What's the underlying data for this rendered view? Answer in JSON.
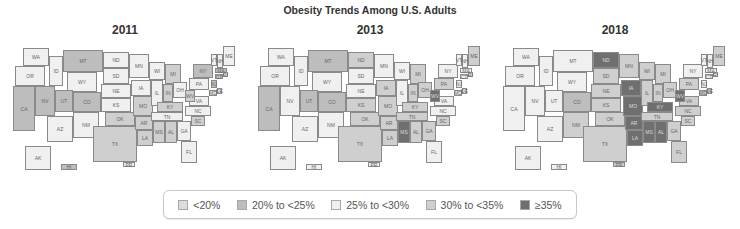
{
  "title": "Obesity Trends Among U.S. Adults",
  "legend": [
    {
      "label": "<20%",
      "class": "c0",
      "color": "#dcdcdc"
    },
    {
      "label": "20% to <25%",
      "class": "c1",
      "color": "#bdbdbd"
    },
    {
      "label": "25% to <30%",
      "class": "c2",
      "color": "#f0f0f0"
    },
    {
      "label": "30% to <35%",
      "class": "c3",
      "color": "#cfcfcf"
    },
    {
      "label": "≥35%",
      "class": "c4",
      "color": "#6f6f6f"
    }
  ],
  "panels": [
    {
      "year": "2011",
      "left": 5
    },
    {
      "year": "2013",
      "left": 250
    },
    {
      "year": "2018",
      "left": 495
    }
  ],
  "states": [
    {
      "id": "WA",
      "x": 18,
      "y": 2,
      "w": 26,
      "h": 18
    },
    {
      "id": "OR",
      "x": 10,
      "y": 20,
      "w": 30,
      "h": 20
    },
    {
      "id": "CA",
      "x": 8,
      "y": 40,
      "w": 22,
      "h": 45
    },
    {
      "id": "ID",
      "x": 44,
      "y": 10,
      "w": 14,
      "h": 30
    },
    {
      "id": "NV",
      "x": 30,
      "y": 40,
      "w": 20,
      "h": 30
    },
    {
      "id": "MT",
      "x": 58,
      "y": 4,
      "w": 40,
      "h": 22
    },
    {
      "id": "WY",
      "x": 62,
      "y": 26,
      "w": 30,
      "h": 20
    },
    {
      "id": "UT",
      "x": 50,
      "y": 44,
      "w": 18,
      "h": 22
    },
    {
      "id": "AZ",
      "x": 42,
      "y": 70,
      "w": 26,
      "h": 26
    },
    {
      "id": "CO",
      "x": 68,
      "y": 46,
      "w": 28,
      "h": 20
    },
    {
      "id": "NM",
      "x": 68,
      "y": 66,
      "w": 26,
      "h": 26
    },
    {
      "id": "ND",
      "x": 98,
      "y": 6,
      "w": 26,
      "h": 16
    },
    {
      "id": "SD",
      "x": 98,
      "y": 22,
      "w": 26,
      "h": 16
    },
    {
      "id": "NE",
      "x": 96,
      "y": 38,
      "w": 30,
      "h": 14
    },
    {
      "id": "KS",
      "x": 96,
      "y": 52,
      "w": 30,
      "h": 14
    },
    {
      "id": "OK",
      "x": 100,
      "y": 66,
      "w": 30,
      "h": 14
    },
    {
      "id": "TX",
      "x": 88,
      "y": 80,
      "w": 44,
      "h": 36
    },
    {
      "id": "MN",
      "x": 124,
      "y": 8,
      "w": 20,
      "h": 24
    },
    {
      "id": "IA",
      "x": 126,
      "y": 34,
      "w": 20,
      "h": 16
    },
    {
      "id": "MO",
      "x": 128,
      "y": 50,
      "w": 20,
      "h": 20
    },
    {
      "id": "AR",
      "x": 130,
      "y": 70,
      "w": 18,
      "h": 14
    },
    {
      "id": "LA",
      "x": 132,
      "y": 84,
      "w": 16,
      "h": 16
    },
    {
      "id": "WI",
      "x": 144,
      "y": 16,
      "w": 16,
      "h": 18
    },
    {
      "id": "IL",
      "x": 146,
      "y": 34,
      "w": 12,
      "h": 26
    },
    {
      "id": "MI",
      "x": 160,
      "y": 18,
      "w": 16,
      "h": 20
    },
    {
      "id": "IN",
      "x": 158,
      "y": 38,
      "w": 10,
      "h": 18
    },
    {
      "id": "OH",
      "x": 168,
      "y": 36,
      "w": 14,
      "h": 16
    },
    {
      "id": "KY",
      "x": 152,
      "y": 56,
      "w": 26,
      "h": 10
    },
    {
      "id": "TN",
      "x": 146,
      "y": 66,
      "w": 32,
      "h": 9
    },
    {
      "id": "MS",
      "x": 148,
      "y": 75,
      "w": 12,
      "h": 22
    },
    {
      "id": "AL",
      "x": 160,
      "y": 75,
      "w": 12,
      "h": 22
    },
    {
      "id": "GA",
      "x": 172,
      "y": 75,
      "w": 14,
      "h": 20
    },
    {
      "id": "FL",
      "x": 176,
      "y": 95,
      "w": 16,
      "h": 22
    },
    {
      "id": "SC",
      "x": 186,
      "y": 70,
      "w": 14,
      "h": 10
    },
    {
      "id": "NC",
      "x": 180,
      "y": 60,
      "w": 26,
      "h": 10
    },
    {
      "id": "VA",
      "x": 184,
      "y": 50,
      "w": 20,
      "h": 10
    },
    {
      "id": "WV",
      "x": 180,
      "y": 44,
      "w": 10,
      "h": 12
    },
    {
      "id": "PA",
      "x": 184,
      "y": 32,
      "w": 20,
      "h": 12
    },
    {
      "id": "NY",
      "x": 188,
      "y": 18,
      "w": 20,
      "h": 14
    },
    {
      "id": "MD",
      "x": 204,
      "y": 44,
      "w": 8,
      "h": 6
    },
    {
      "id": "DE",
      "x": 212,
      "y": 42,
      "w": 5,
      "h": 6
    },
    {
      "id": "NJ",
      "x": 206,
      "y": 34,
      "w": 6,
      "h": 8
    },
    {
      "id": "CT",
      "x": 210,
      "y": 28,
      "w": 8,
      "h": 5
    },
    {
      "id": "RI",
      "x": 218,
      "y": 26,
      "w": 5,
      "h": 5
    },
    {
      "id": "MA",
      "x": 210,
      "y": 22,
      "w": 12,
      "h": 5
    },
    {
      "id": "VT",
      "x": 206,
      "y": 8,
      "w": 6,
      "h": 12
    },
    {
      "id": "NH",
      "x": 212,
      "y": 8,
      "w": 6,
      "h": 14
    },
    {
      "id": "ME",
      "x": 218,
      "y": 0,
      "w": 12,
      "h": 20
    },
    {
      "id": "AK",
      "x": 20,
      "y": 100,
      "w": 26,
      "h": 24
    },
    {
      "id": "HI",
      "x": 56,
      "y": 118,
      "w": 16,
      "h": 6
    },
    {
      "id": "PR",
      "x": 118,
      "y": 116,
      "w": 12,
      "h": 5
    }
  ],
  "categories_by_year": {
    "2011": {
      "WA": "c2",
      "OR": "c2",
      "CA": "c1",
      "ID": "c2",
      "NV": "c1",
      "MT": "c1",
      "WY": "c2",
      "UT": "c1",
      "AZ": "c2",
      "CO": "c1",
      "NM": "c2",
      "ND": "c2",
      "SD": "c2",
      "NE": "c2",
      "KS": "c2",
      "OK": "c3",
      "TX": "c3",
      "MN": "c2",
      "IA": "c2",
      "MO": "c3",
      "AR": "c3",
      "LA": "c3",
      "WI": "c2",
      "IL": "c2",
      "MI": "c3",
      "IN": "c3",
      "OH": "c2",
      "KY": "c3",
      "TN": "c2",
      "MS": "c3",
      "AL": "c3",
      "GA": "c2",
      "FL": "c2",
      "SC": "c3",
      "NC": "c2",
      "VA": "c2",
      "WV": "c3",
      "PA": "c2",
      "NY": "c1",
      "MD": "c2",
      "DE": "c2",
      "NJ": "c1",
      "CT": "c1",
      "RI": "c2",
      "MA": "c1",
      "VT": "c2",
      "NH": "c2",
      "ME": "c2",
      "AK": "c2",
      "HI": "c1",
      "PR": "c2"
    },
    "2013": {
      "WA": "c2",
      "OR": "c2",
      "CA": "c1",
      "ID": "c2",
      "NV": "c2",
      "MT": "c1",
      "WY": "c2",
      "UT": "c1",
      "AZ": "c2",
      "CO": "c1",
      "NM": "c2",
      "ND": "c3",
      "SD": "c2",
      "NE": "c2",
      "KS": "c3",
      "OK": "c3",
      "TX": "c3",
      "MN": "c2",
      "IA": "c3",
      "MO": "c3",
      "AR": "c3",
      "LA": "c3",
      "WI": "c2",
      "IL": "c2",
      "MI": "c3",
      "IN": "c3",
      "OH": "c3",
      "KY": "c3",
      "TN": "c3",
      "MS": "c4",
      "AL": "c3",
      "GA": "c3",
      "FL": "c2",
      "SC": "c3",
      "NC": "c2",
      "VA": "c2",
      "WV": "c4",
      "PA": "c3",
      "NY": "c2",
      "MD": "c2",
      "DE": "c2",
      "NJ": "c2",
      "CT": "c2",
      "RI": "c2",
      "MA": "c2",
      "VT": "c2",
      "NH": "c2",
      "ME": "c3",
      "AK": "c2",
      "HI": "c2",
      "PR": "c2"
    },
    "2018": {
      "WA": "c2",
      "OR": "c2",
      "CA": "c2",
      "ID": "c2",
      "NV": "c2",
      "MT": "c2",
      "WY": "c2",
      "UT": "c2",
      "AZ": "c2",
      "CO": "c1",
      "NM": "c3",
      "ND": "c4",
      "SD": "c3",
      "NE": "c3",
      "KS": "c3",
      "OK": "c3",
      "TX": "c3",
      "MN": "c3",
      "IA": "c4",
      "MO": "c4",
      "AR": "c4",
      "LA": "c4",
      "WI": "c3",
      "IL": "c3",
      "MI": "c3",
      "IN": "c3",
      "OH": "c3",
      "KY": "c4",
      "TN": "c3",
      "MS": "c4",
      "AL": "c4",
      "GA": "c3",
      "FL": "c3",
      "SC": "c3",
      "NC": "c3",
      "VA": "c3",
      "WV": "c4",
      "PA": "c3",
      "NY": "c2",
      "MD": "c3",
      "DE": "c3",
      "NJ": "c2",
      "CT": "c2",
      "RI": "c2",
      "MA": "c2",
      "VT": "c2",
      "NH": "c2",
      "ME": "c3",
      "AK": "c2",
      "HI": "c2",
      "PR": "c3"
    }
  }
}
